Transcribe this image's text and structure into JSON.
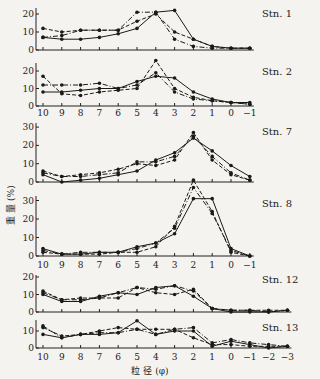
{
  "chart_data": {
    "type": "line",
    "xlabel": "粒 径 (φ)",
    "ylabel": "重 量 (%)",
    "series_styles": [
      {
        "name": "series-a",
        "dash": "none"
      },
      {
        "name": "series-b",
        "dash": "4,2"
      },
      {
        "name": "series-c",
        "dash": "5,2,1,2"
      },
      {
        "name": "series-d",
        "dash": "2,2"
      }
    ],
    "panels": [
      {
        "title": "Stn. 1",
        "x": [
          10,
          9,
          8,
          7,
          6,
          5,
          4,
          3,
          2,
          1,
          0,
          -1
        ],
        "xtick_labels_shown": false,
        "ylim": [
          0,
          22
        ],
        "yticks": [
          0,
          10,
          20
        ],
        "series": [
          {
            "name": "series-a",
            "values": [
              7,
              6,
              6,
              7,
              9,
              12,
              21,
              22,
              6,
              2,
              1,
              1
            ]
          },
          {
            "name": "series-b",
            "values": [
              12,
              10,
              11,
              11,
              11,
              16,
              20,
              10,
              6,
              2,
              1,
              1
            ]
          },
          {
            "name": "series-c",
            "values": [
              7,
              8,
              11,
              11,
              11,
              21,
              21,
              6,
              2,
              1,
              1,
              1
            ]
          }
        ]
      },
      {
        "title": "Stn. 2",
        "x": [
          10,
          9,
          8,
          7,
          6,
          5,
          4,
          3,
          2,
          1,
          0,
          -1
        ],
        "xtick_labels_shown": true,
        "ylim": [
          0,
          26
        ],
        "yticks": [
          0,
          10,
          20
        ],
        "series": [
          {
            "name": "series-a",
            "values": [
              8,
              8,
              9,
              10,
              10,
              14,
              17,
              16,
              8,
              4,
              2,
              2
            ]
          },
          {
            "name": "series-b",
            "values": [
              17,
              7,
              6,
              8,
              9,
              10,
              26,
              10,
              5,
              3,
              2,
              1
            ]
          },
          {
            "name": "series-c",
            "values": [
              12,
              12,
              12,
              13,
              10,
              12,
              19,
              8,
              4,
              3,
              2,
              1
            ]
          }
        ]
      },
      {
        "title": "Stn. 7",
        "x": [
          10,
          9,
          8,
          7,
          6,
          5,
          4,
          3,
          2,
          1,
          0,
          -1
        ],
        "xtick_labels_shown": false,
        "ylim": [
          0,
          30
        ],
        "yticks": [
          0,
          10,
          20,
          30
        ],
        "series": [
          {
            "name": "series-a",
            "values": [
              4,
              0,
              1,
              2,
              4,
              6,
              12,
              16,
              24,
              17,
              9,
              3
            ]
          },
          {
            "name": "series-b",
            "values": [
              6,
              3,
              4,
              5,
              7,
              10,
              9,
              12,
              27,
              12,
              4,
              1
            ]
          },
          {
            "name": "series-c",
            "values": [
              5,
              3,
              3,
              4,
              5,
              11,
              11,
              14,
              25,
              14,
              5,
              1
            ]
          }
        ]
      },
      {
        "title": "Stn. 8",
        "x": [
          10,
          9,
          8,
          7,
          6,
          5,
          4,
          3,
          2,
          1,
          0,
          -1
        ],
        "xtick_labels_shown": true,
        "ylim": [
          0,
          40
        ],
        "yticks": [
          0,
          10,
          20,
          30
        ],
        "series": [
          {
            "name": "series-a",
            "values": [
              4,
              1,
              1,
              2,
              2,
              5,
              7,
              12,
              31,
              31,
              4,
              0
            ]
          },
          {
            "name": "series-b",
            "values": [
              2,
              1,
              1,
              1,
              2,
              2,
              5,
              16,
              41,
              24,
              2,
              0
            ]
          },
          {
            "name": "series-c",
            "values": [
              3,
              1,
              2,
              2,
              2,
              4,
              7,
              15,
              37,
              23,
              3,
              0
            ]
          }
        ]
      },
      {
        "title": "Stn. 12",
        "x": [
          10,
          9,
          8,
          7,
          6,
          5,
          4,
          3,
          2,
          1,
          0,
          -1,
          -2,
          -3
        ],
        "xtick_labels_shown": false,
        "ylim": [
          0,
          20
        ],
        "yticks": [
          0,
          10,
          20
        ],
        "series": [
          {
            "name": "series-a",
            "values": [
              10,
              6,
              6,
              9,
              11,
              10,
              14,
              15,
              9,
              2,
              0,
              0,
              0,
              1
            ]
          },
          {
            "name": "series-b",
            "values": [
              12,
              7,
              8,
              8,
              8,
              14,
              11,
              10,
              13,
              2,
              1,
              1,
              1,
              1
            ]
          },
          {
            "name": "series-c",
            "values": [
              11,
              7,
              7,
              8,
              11,
              14,
              13,
              15,
              12,
              2,
              1,
              1,
              0,
              1
            ]
          }
        ]
      },
      {
        "title": "Stn. 13",
        "x": [
          10,
          9,
          8,
          7,
          6,
          5,
          4,
          3,
          2,
          1,
          0,
          -1,
          -2,
          -3
        ],
        "xtick_labels_shown": true,
        "ylim": [
          0,
          17
        ],
        "yticks": [
          0,
          10
        ],
        "series": [
          {
            "name": "series-a",
            "values": [
              8,
              6,
              8,
              8,
              9,
              16,
              8,
              10,
              10,
              1,
              4,
              2,
              0,
              1
            ]
          },
          {
            "name": "series-b",
            "values": [
              12,
              7,
              8,
              10,
              12,
              11,
              11,
              11,
              6,
              2,
              2,
              1,
              1,
              1
            ]
          },
          {
            "name": "series-c",
            "values": [
              13,
              6,
              8,
              9,
              9,
              11,
              8,
              11,
              12,
              3,
              5,
              3,
              2,
              1
            ]
          }
        ]
      }
    ],
    "x_tick_labels": [
      "10",
      "9",
      "8",
      "7",
      "6",
      "5",
      "4",
      "3",
      "2",
      "1",
      "0",
      "−1",
      "−2",
      "−3"
    ]
  }
}
